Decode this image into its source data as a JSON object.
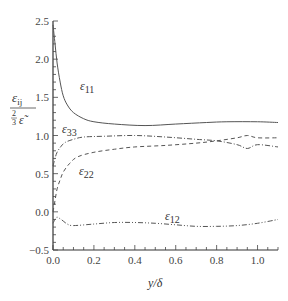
{
  "chart_data": {
    "type": "line",
    "title": "",
    "xlabel": "y/δ",
    "ylabel": "ε_ij / (2/3 ε̃)",
    "xlim": [
      0.0,
      1.1
    ],
    "ylim": [
      -0.5,
      2.5
    ],
    "xticks": [
      0.0,
      0.2,
      0.4,
      0.6,
      0.8,
      1.0
    ],
    "xtick_labels": [
      "0.0",
      "0.2",
      "0.4",
      "0.6",
      "0.8",
      "1.0"
    ],
    "yticks": [
      -0.5,
      0.0,
      0.5,
      1.0,
      1.5,
      2.0,
      2.5
    ],
    "ytick_labels": [
      "−0.5",
      "0.0",
      "0.5",
      "1.0",
      "1.5",
      "2.0",
      "2.5"
    ],
    "grid": false,
    "legend": "inline labels",
    "series": [
      {
        "name": "ε11",
        "label_main": "ε",
        "label_sub": "11",
        "style": "solid",
        "x": [
          0.0,
          0.01,
          0.02,
          0.035,
          0.05,
          0.07,
          0.1,
          0.15,
          0.2,
          0.3,
          0.45,
          0.6,
          0.75,
          0.85,
          1.0,
          1.1
        ],
        "y": [
          2.45,
          2.2,
          1.95,
          1.7,
          1.52,
          1.4,
          1.3,
          1.22,
          1.18,
          1.15,
          1.13,
          1.15,
          1.17,
          1.18,
          1.18,
          1.17
        ]
      },
      {
        "name": "ε33",
        "label_main": "ε",
        "label_sub": "33",
        "style": "dashdot",
        "x": [
          0.0,
          0.01,
          0.02,
          0.04,
          0.06,
          0.1,
          0.15,
          0.25,
          0.4,
          0.55,
          0.7,
          0.8,
          0.9,
          0.95,
          1.0,
          1.1
        ],
        "y": [
          0.6,
          0.7,
          0.78,
          0.86,
          0.91,
          0.95,
          0.98,
          0.99,
          1.0,
          0.98,
          0.95,
          0.93,
          0.88,
          0.83,
          0.88,
          0.85
        ]
      },
      {
        "name": "ε22",
        "label_main": "ε",
        "label_sub": "22",
        "style": "dashed",
        "x": [
          0.0,
          0.01,
          0.02,
          0.035,
          0.05,
          0.08,
          0.12,
          0.2,
          0.3,
          0.4,
          0.55,
          0.7,
          0.8,
          0.9,
          0.95,
          1.0,
          1.1
        ],
        "y": [
          0.0,
          0.15,
          0.3,
          0.42,
          0.52,
          0.63,
          0.72,
          0.78,
          0.82,
          0.85,
          0.87,
          0.9,
          0.93,
          0.97,
          1.0,
          0.97,
          0.97
        ]
      },
      {
        "name": "ε12",
        "label_main": "ε",
        "label_sub": "12",
        "style": "dashdotdot",
        "x": [
          0.0,
          0.01,
          0.02,
          0.04,
          0.07,
          0.1,
          0.2,
          0.3,
          0.4,
          0.5,
          0.6,
          0.7,
          0.8,
          0.9,
          1.0,
          1.1
        ],
        "y": [
          -0.15,
          -0.1,
          -0.07,
          -0.1,
          -0.16,
          -0.18,
          -0.16,
          -0.14,
          -0.14,
          -0.15,
          -0.17,
          -0.19,
          -0.19,
          -0.18,
          -0.15,
          -0.1
        ]
      }
    ]
  },
  "labels": {
    "ylabel_top": "ε",
    "ylabel_top_sub": "ij",
    "ylabel_frac_num": "2",
    "ylabel_frac_den": "3",
    "ylabel_bottom": "ε̃",
    "xlabel": "y/δ"
  }
}
